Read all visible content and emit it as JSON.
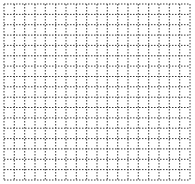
{
  "diagram": {
    "type": "dotted-grid",
    "background": "#ffffff",
    "line_color": "#3a3a3a",
    "box": {
      "x": 4,
      "y": 4,
      "width": 186,
      "height": 176
    },
    "columns": 18,
    "rows": 17,
    "cell_size": 10.3,
    "dash": "1.5,1.5"
  }
}
